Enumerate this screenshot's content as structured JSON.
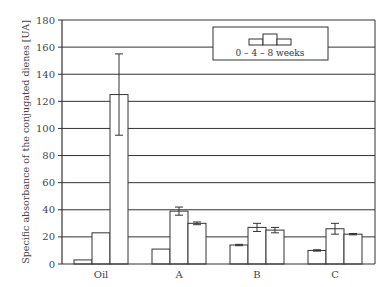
{
  "chart_data": {
    "type": "bar",
    "title": "",
    "xlabel": "",
    "ylabel": "Specific absorbance of the conjugated dienes [UA]",
    "ylim": [
      0,
      180
    ],
    "yticks": [
      0,
      20,
      40,
      60,
      80,
      100,
      120,
      140,
      160,
      180
    ],
    "grid": true,
    "legend_position": "upper right",
    "legend_label": "0 – 4 – 8 weeks",
    "categories": [
      "Oil",
      "A",
      "B",
      "C"
    ],
    "series": [
      {
        "name": "0 weeks",
        "values": [
          3,
          11,
          14,
          10
        ],
        "errors": [
          0,
          0,
          0.5,
          0.5
        ]
      },
      {
        "name": "4 weeks",
        "values": [
          23,
          39,
          27,
          26
        ],
        "errors": [
          0,
          3,
          3,
          4
        ]
      },
      {
        "name": "8 weeks",
        "values": [
          125,
          30,
          25,
          22
        ],
        "errors": [
          30,
          1,
          2,
          0.5
        ]
      }
    ]
  },
  "colors": {
    "bar_fill": "#ffffff",
    "bar_stroke": "#333333",
    "grid": "#333333"
  }
}
